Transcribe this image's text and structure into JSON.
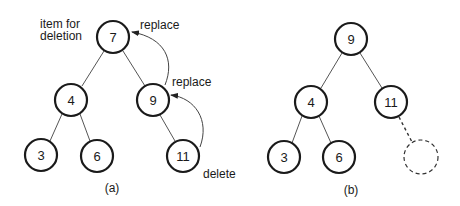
{
  "diagram": {
    "panel_a": {
      "caption": "(a)",
      "annotations": {
        "item_for_deletion_line1": "item for",
        "item_for_deletion_line2": "deletion",
        "replace_top": "replace",
        "replace_mid": "replace",
        "delete": "delete"
      },
      "nodes": [
        {
          "id": "a7",
          "label": "7",
          "x": 113,
          "y": 37
        },
        {
          "id": "a4",
          "label": "4",
          "x": 71,
          "y": 100
        },
        {
          "id": "a9",
          "label": "9",
          "x": 153,
          "y": 100
        },
        {
          "id": "a3",
          "label": "3",
          "x": 41,
          "y": 155
        },
        {
          "id": "a6",
          "label": "6",
          "x": 97,
          "y": 156
        },
        {
          "id": "a11",
          "label": "11",
          "x": 183,
          "y": 156
        }
      ],
      "edges": [
        [
          "a7",
          "a4"
        ],
        [
          "a7",
          "a9"
        ],
        [
          "a4",
          "a3"
        ],
        [
          "a4",
          "a6"
        ],
        [
          "a9",
          "a11"
        ]
      ]
    },
    "panel_b": {
      "caption": "(b)",
      "nodes": [
        {
          "id": "b9",
          "label": "9",
          "x": 351,
          "y": 39
        },
        {
          "id": "b4",
          "label": "4",
          "x": 311,
          "y": 102
        },
        {
          "id": "b11",
          "label": "11",
          "x": 391,
          "y": 102
        },
        {
          "id": "b3",
          "label": "3",
          "x": 284,
          "y": 157
        },
        {
          "id": "b6",
          "label": "6",
          "x": 339,
          "y": 157
        }
      ],
      "removed_node": {
        "x": 421,
        "y": 157
      },
      "edges": [
        [
          "b9",
          "b4"
        ],
        [
          "b9",
          "b11"
        ],
        [
          "b4",
          "b3"
        ],
        [
          "b4",
          "b6"
        ]
      ]
    }
  }
}
